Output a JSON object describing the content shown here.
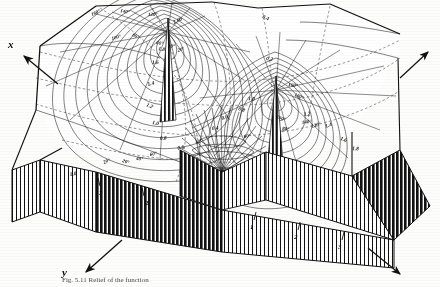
{
  "figure": {
    "caption": "Fig. 5.11  Relief of the function",
    "background_color": "#fdfdfc",
    "ink_color": "#111111"
  },
  "axes": {
    "x_label": "x",
    "y_label": "y",
    "x_arrow_name": "x-axis-arrow",
    "y_arrow_name": "y-axis-arrow",
    "right_arrow_name": "right-axis-arrow",
    "bottom_right_arrow_name": "bottom-right-axis-arrow"
  },
  "ticks": {
    "front_left_edge": [
      "1",
      "2",
      "3"
    ],
    "front_right_edge": [
      "1",
      "2",
      "3"
    ]
  },
  "contour_labels": [
    {
      "text": "2.00",
      "x": 174,
      "y": 24
    },
    {
      "text": "1.8",
      "x": 158,
      "y": 50
    },
    {
      "text": "1.6",
      "x": 152,
      "y": 64
    },
    {
      "text": "1.4",
      "x": 148,
      "y": 86
    },
    {
      "text": "1.2",
      "x": 146,
      "y": 106
    },
    {
      "text": "1.0",
      "x": 152,
      "y": 124
    },
    {
      "text": "0.8",
      "x": 160,
      "y": 140
    },
    {
      "text": "0.6",
      "x": 178,
      "y": 150
    },
    {
      "text": "0.4",
      "x": 262,
      "y": 18
    },
    {
      "text": "0.2",
      "x": 266,
      "y": 60
    },
    {
      "text": "0.4",
      "x": 212,
      "y": 130
    },
    {
      "text": "0.6",
      "x": 222,
      "y": 120
    },
    {
      "text": "0.8",
      "x": 238,
      "y": 110
    },
    {
      "text": "1.0",
      "x": 248,
      "y": 100
    },
    {
      "text": "1.2",
      "x": 304,
      "y": 116
    },
    {
      "text": "1.4",
      "x": 326,
      "y": 128
    },
    {
      "text": "1.6",
      "x": 340,
      "y": 140
    },
    {
      "text": "1.8",
      "x": 352,
      "y": 150
    },
    {
      "text": "1.0",
      "x": 70,
      "y": 176
    }
  ],
  "angle_labels": [
    {
      "text": "160°",
      "x": 92,
      "y": 16
    },
    {
      "text": "140°",
      "x": 120,
      "y": 12
    },
    {
      "text": "120°",
      "x": 148,
      "y": 16
    },
    {
      "text": "100°",
      "x": 112,
      "y": 40
    },
    {
      "text": "80°",
      "x": 132,
      "y": 36
    },
    {
      "text": "60°",
      "x": 156,
      "y": 44
    },
    {
      "text": "40°",
      "x": 168,
      "y": 48
    },
    {
      "text": "20°",
      "x": 178,
      "y": 52
    },
    {
      "text": "180°",
      "x": 294,
      "y": 96
    },
    {
      "text": "160°",
      "x": 288,
      "y": 86
    },
    {
      "text": "140°",
      "x": 302,
      "y": 124
    },
    {
      "text": "120°",
      "x": 312,
      "y": 128
    },
    {
      "text": "100°",
      "x": 276,
      "y": 118
    },
    {
      "text": "80°",
      "x": 282,
      "y": 130
    },
    {
      "text": "60°",
      "x": 244,
      "y": 138
    },
    {
      "text": "40°",
      "x": 196,
      "y": 144
    },
    {
      "text": "20°",
      "x": 122,
      "y": 162
    },
    {
      "text": "40°",
      "x": 136,
      "y": 160
    },
    {
      "text": "60°",
      "x": 150,
      "y": 156
    },
    {
      "text": "20°",
      "x": 104,
      "y": 164
    }
  ]
}
